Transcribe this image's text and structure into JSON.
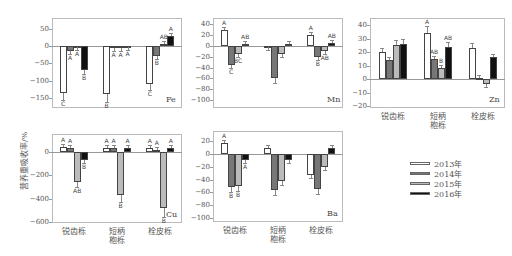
{
  "chart_data": [
    {
      "type": "bar",
      "panel": "Fe",
      "ylabel": "营养重吸收率/%",
      "categories": [
        "锐齿栎",
        "短柄枹栎",
        "栓皮栎"
      ],
      "yticks": [
        50,
        0,
        -50,
        -100,
        -150
      ],
      "ylim": [
        -170,
        80
      ],
      "series": [
        {
          "name": "2013年",
          "values": [
            -135,
            -140,
            -110
          ],
          "sig": [
            "C",
            "B",
            "C"
          ]
        },
        {
          "name": "2014年",
          "values": [
            -15,
            -5,
            -30
          ],
          "sig": [
            "A",
            "A",
            "B"
          ]
        },
        {
          "name": "2015年",
          "values": [
            -2,
            -5,
            5
          ],
          "sig": [
            "A",
            "A",
            "AB"
          ]
        },
        {
          "name": "2016年",
          "values": [
            -70,
            -3,
            30
          ],
          "sig": [
            "B",
            "A",
            "A"
          ]
        }
      ]
    },
    {
      "type": "bar",
      "panel": "Mn",
      "categories": [
        "锐齿栎",
        "短柄枹栎",
        "栓皮栎"
      ],
      "yticks": [
        40,
        20,
        0,
        -20,
        -40,
        -60,
        -80,
        -100
      ],
      "ylim": [
        -110,
        50
      ],
      "series": [
        {
          "name": "2013年",
          "values": [
            30,
            -2,
            20
          ],
          "sig": [
            "A",
            "",
            "A"
          ]
        },
        {
          "name": "2014年",
          "values": [
            -36,
            -60,
            -20
          ],
          "sig": [
            "C",
            "",
            "B"
          ]
        },
        {
          "name": "2015年",
          "values": [
            -14,
            -15,
            -10
          ],
          "sig": [
            "BC",
            "",
            "AB"
          ]
        },
        {
          "name": "2016年",
          "values": [
            3,
            3,
            5
          ],
          "sig": [
            "AB",
            "",
            "AB"
          ]
        }
      ]
    },
    {
      "type": "bar",
      "panel": "Zn",
      "categories": [
        "锐齿栎",
        "短柄枹栎",
        "栓皮栎"
      ],
      "yticks": [
        40,
        30,
        20,
        10,
        0,
        -10,
        -20
      ],
      "ylim": [
        -20,
        45
      ],
      "series": [
        {
          "name": "2013年",
          "values": [
            20,
            34,
            23
          ],
          "sig": [
            "",
            "A",
            ""
          ]
        },
        {
          "name": "2014年",
          "values": [
            14,
            15,
            1
          ],
          "sig": [
            "",
            "AB",
            ""
          ]
        },
        {
          "name": "2015年",
          "values": [
            25,
            8,
            -4
          ],
          "sig": [
            "",
            "B",
            ""
          ]
        },
        {
          "name": "2016年",
          "values": [
            26,
            24,
            16
          ],
          "sig": [
            "",
            "AB",
            ""
          ]
        }
      ]
    },
    {
      "type": "bar",
      "panel": "Cu",
      "categories": [
        "锐齿栎",
        "短柄枹栎",
        "栓皮栎"
      ],
      "yticks": [
        0,
        -200,
        -400,
        -600
      ],
      "ylim": [
        -600,
        150
      ],
      "series": [
        {
          "name": "2013年",
          "values": [
            40,
            35,
            35
          ],
          "sig": [
            "A",
            "A",
            "A"
          ]
        },
        {
          "name": "2014年",
          "values": [
            30,
            35,
            15
          ],
          "sig": [
            "A",
            "A",
            "A"
          ]
        },
        {
          "name": "2015年",
          "values": [
            -260,
            -370,
            -480
          ],
          "sig": [
            "AB",
            "B",
            "B"
          ]
        },
        {
          "name": "2016年",
          "values": [
            -65,
            30,
            30
          ],
          "sig": [
            "B",
            "A",
            "A"
          ]
        }
      ]
    },
    {
      "type": "bar",
      "panel": "Ba",
      "categories": [
        "锐齿栎",
        "短柄枹栎",
        "栓皮栎"
      ],
      "yticks": [
        20,
        0,
        -20,
        -40,
        -60,
        -80,
        -100
      ],
      "ylim": [
        -105,
        35
      ],
      "series": [
        {
          "name": "2013年",
          "values": [
            17,
            9,
            -33
          ],
          "sig": [
            "A",
            "",
            ""
          ]
        },
        {
          "name": "2014年",
          "values": [
            -52,
            -56,
            -54
          ],
          "sig": [
            "B",
            "",
            ""
          ]
        },
        {
          "name": "2015年",
          "values": [
            -50,
            -42,
            -20
          ],
          "sig": [
            "B",
            "",
            ""
          ]
        },
        {
          "name": "2016年",
          "values": [
            -10,
            -10,
            10
          ],
          "sig": [
            "A",
            "",
            ""
          ]
        }
      ]
    }
  ],
  "ylabel": "营养重吸收率/%",
  "categories": [
    "锐齿栎",
    "短柄\n枹栎",
    "栓皮栎"
  ],
  "legend": [
    {
      "label": "2013年",
      "color": "#ffffff"
    },
    {
      "label": "2014年",
      "color": "#777777"
    },
    {
      "label": "2015年",
      "color": "#bbbbbb"
    },
    {
      "label": "2016年",
      "color": "#111111"
    }
  ]
}
